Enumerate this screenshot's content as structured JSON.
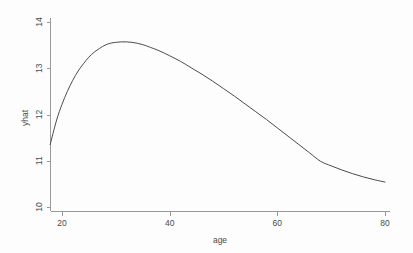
{
  "chart_data": {
    "type": "line",
    "title": "",
    "subtitle": "",
    "xlabel": "age",
    "ylabel": "yhat",
    "xlim": [
      17.8,
      80
    ],
    "ylim": [
      10,
      14
    ],
    "xticks": [
      20,
      40,
      60,
      80
    ],
    "xtick_labels": [
      "20",
      "40",
      "60",
      "80"
    ],
    "yticks": [
      10,
      11,
      12,
      13,
      14
    ],
    "ytick_labels": [
      "10",
      "11",
      "12",
      "13",
      "14"
    ],
    "grid": false,
    "legend": null,
    "legend_position": "none",
    "annotations": [],
    "series": [
      {
        "name": "yhat",
        "color": "#4b4b4b",
        "x": [
          17.8,
          19,
          20,
          21,
          22,
          23,
          24,
          25,
          26,
          27,
          28,
          29,
          30,
          31,
          32,
          33,
          34,
          35,
          36,
          38,
          40,
          42,
          44,
          46,
          48,
          50,
          52,
          54,
          56,
          58,
          60,
          62,
          64,
          66,
          68,
          70,
          72,
          74,
          76,
          78,
          80
        ],
        "y": [
          11.35,
          11.88,
          12.22,
          12.5,
          12.74,
          12.94,
          13.1,
          13.24,
          13.35,
          13.43,
          13.5,
          13.54,
          13.56,
          13.57,
          13.57,
          13.56,
          13.54,
          13.51,
          13.47,
          13.38,
          13.27,
          13.15,
          13.01,
          12.87,
          12.72,
          12.56,
          12.4,
          12.23,
          12.06,
          11.89,
          11.71,
          11.53,
          11.35,
          11.17,
          10.99,
          10.89,
          10.8,
          10.72,
          10.65,
          10.59,
          10.54
        ]
      }
    ],
    "peak": {
      "x": 32.5,
      "y": 13.57
    },
    "start_point": {
      "x": 17.8,
      "y": 11.35
    },
    "end_point": {
      "x": 80,
      "y": 10.54
    }
  },
  "plot": {
    "background_color": "#fdfdfd",
    "axis_color": "#9a9a9a",
    "line_color": "#4b4b4b",
    "tick_label_color": "#4a4a4a"
  }
}
